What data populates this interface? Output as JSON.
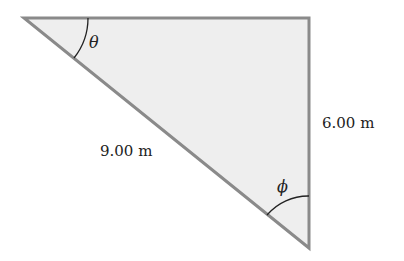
{
  "diagram": {
    "type": "right-triangle",
    "vertices": {
      "top_left": [
        24,
        18
      ],
      "top_right": [
        309,
        18
      ],
      "bottom_right": [
        309,
        248
      ]
    },
    "fill_color": "#eeeeee",
    "stroke_color": "#8a8a8a",
    "labels": {
      "hypotenuse": "9.00 m",
      "vertical_side": "6.00 m",
      "angle_left": "θ",
      "angle_bottom": "ϕ"
    }
  }
}
